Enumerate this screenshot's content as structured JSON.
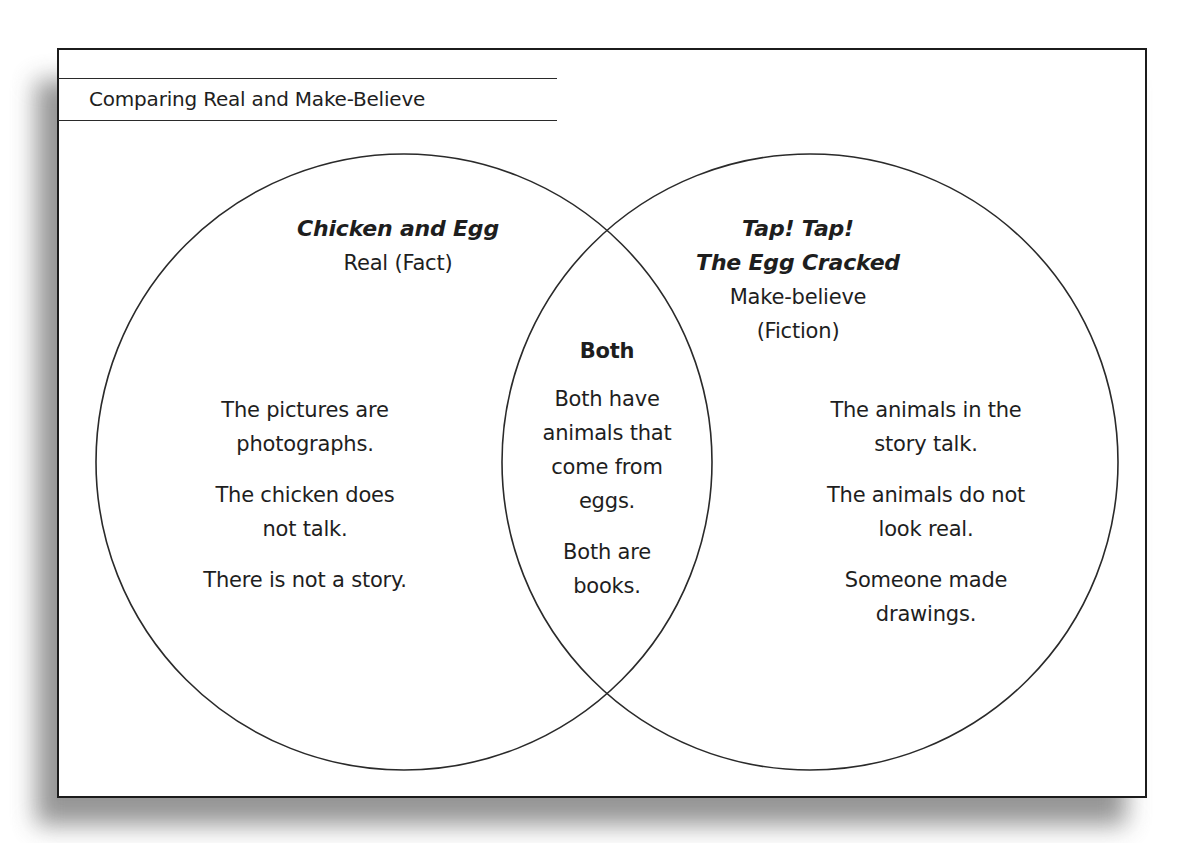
{
  "title": "Comparing Real and Make-Believe",
  "diagram": {
    "type": "venn",
    "left": {
      "book_title": "Chicken and Egg",
      "category": "Real (Fact)",
      "items": [
        [
          "The pictures are",
          "photographs."
        ],
        [
          "The chicken does",
          "not talk."
        ],
        [
          "There is not a story."
        ]
      ]
    },
    "center": {
      "heading": "Both",
      "items": [
        [
          "Both have",
          "animals that",
          "come from",
          "eggs."
        ],
        [
          "Both are",
          "books."
        ]
      ]
    },
    "right": {
      "book_title_line1": "Tap! Tap!",
      "book_title_line2": "The Egg Cracked",
      "category_line1": "Make-believe",
      "category_line2": "(Fiction)",
      "items": [
        [
          "The animals in the",
          "story talk."
        ],
        [
          "The animals do not",
          "look real."
        ],
        [
          "Someone made",
          "drawings."
        ]
      ]
    }
  },
  "colors": {
    "line": "#2a2a2a",
    "text": "#1e1e1e",
    "background": "#ffffff",
    "shadow": "#8a8a8a"
  }
}
